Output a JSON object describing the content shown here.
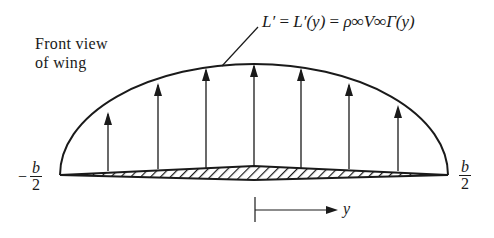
{
  "diagram": {
    "title_line1": "Front view",
    "title_line2": "of wing",
    "equation": {
      "lhs": "L′",
      "eq1": " = ",
      "mid": "L′(y)",
      "eq2": " = ",
      "rhs": "ρ∞V∞Γ(y)"
    },
    "left_tip": {
      "sign": "−",
      "num": "b",
      "den": "2"
    },
    "right_tip": {
      "num": "b",
      "den": "2"
    },
    "axis_label": "y",
    "arrow_count": 7,
    "colors": {
      "ink": "#1a1a1a",
      "background": "#ffffff"
    }
  }
}
